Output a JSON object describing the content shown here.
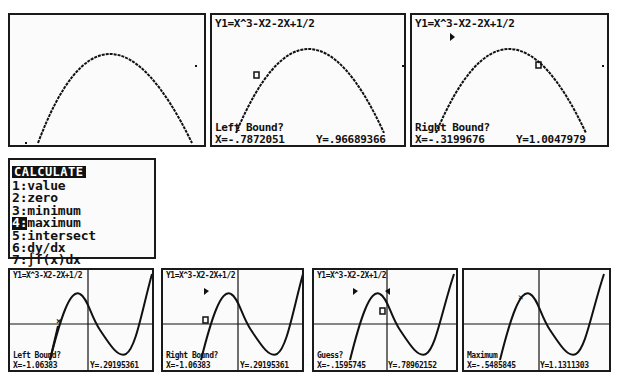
{
  "equation": "Y1=X^3-X2-2X+1/2",
  "top_row": {
    "screen1": {
      "equation": "",
      "prompt": "",
      "x": "",
      "y": ""
    },
    "screen2": {
      "equation": "Y1=X^3-X2-2X+1/2",
      "prompt": "Left Bound?",
      "x": "X=-.7872051",
      "y": "Y=.96689366"
    },
    "screen3": {
      "equation": "Y1=X^3-X2-2X+1/2",
      "prompt": "Right Bound?",
      "x": "X=-.3199676",
      "y": "Y=1.0047979"
    }
  },
  "menu": {
    "title": "CALCULATE",
    "selected_index": 3,
    "items": [
      {
        "num": "1:",
        "label": "value"
      },
      {
        "num": "2:",
        "label": "zero"
      },
      {
        "num": "3:",
        "label": "minimum"
      },
      {
        "num": "4:",
        "label": "maximum"
      },
      {
        "num": "5:",
        "label": "intersect"
      },
      {
        "num": "6:",
        "label": "dy/dx"
      },
      {
        "num": "7:",
        "label": "∫f(x)dx"
      }
    ]
  },
  "bottom_row": {
    "screen1": {
      "equation": "Y1=X^3-X2-2X+1/2",
      "prompt": "Left Bound?",
      "x": "X=-1.06383",
      "y": "Y=.29195361"
    },
    "screen2": {
      "equation": "Y1=X^3-X2-2X+1/2",
      "prompt": "Right Bound?",
      "x": "X=-1.06383",
      "y": "Y=.29195361"
    },
    "screen3": {
      "equation": "Y1=X^3-X2-2X+1/2",
      "prompt": "Guess?",
      "x": "X=-.1595745",
      "y": "Y=.78962152"
    },
    "screen4": {
      "equation": "",
      "prompt": "Maximum",
      "x": "X=-.5485845",
      "y": "Y=1.1311303"
    }
  },
  "colors": {
    "ink": "#111111",
    "screen_bg": "#fbfbfb",
    "border": "#1a1a1a"
  }
}
